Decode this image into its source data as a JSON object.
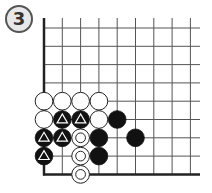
{
  "diagram": {
    "label": "3",
    "type": "go-board-partial",
    "corner": "bottom-left",
    "grid": {
      "origin_x": 44,
      "origin_y": 28,
      "spacing": 18.3,
      "columns": 9,
      "rows": 9,
      "right_extent": 200,
      "top_extent": 18
    },
    "colors": {
      "line": "#555555",
      "edge": "#222222",
      "black_stone": "#111111",
      "white_stone": "#ffffff",
      "stone_outline": "#222222",
      "badge_fill": "#e8e8e8",
      "badge_stroke": "#555555"
    },
    "stones": [
      {
        "col": 0,
        "row": 4,
        "color": "white",
        "mark": "none"
      },
      {
        "col": 1,
        "row": 4,
        "color": "white",
        "mark": "none"
      },
      {
        "col": 2,
        "row": 4,
        "color": "white",
        "mark": "none"
      },
      {
        "col": 3,
        "row": 4,
        "color": "white",
        "mark": "none"
      },
      {
        "col": 0,
        "row": 5,
        "color": "white",
        "mark": "none"
      },
      {
        "col": 1,
        "row": 5,
        "color": "black",
        "mark": "triangle"
      },
      {
        "col": 2,
        "row": 5,
        "color": "black",
        "mark": "triangle"
      },
      {
        "col": 3,
        "row": 5,
        "color": "white",
        "mark": "none"
      },
      {
        "col": 4,
        "row": 5,
        "color": "black",
        "mark": "none"
      },
      {
        "col": 0,
        "row": 6,
        "color": "black",
        "mark": "triangle"
      },
      {
        "col": 1,
        "row": 6,
        "color": "black",
        "mark": "triangle"
      },
      {
        "col": 2,
        "row": 6,
        "color": "white",
        "mark": "double-circle"
      },
      {
        "col": 3,
        "row": 6,
        "color": "black",
        "mark": "none"
      },
      {
        "col": 5,
        "row": 6,
        "color": "black",
        "mark": "none"
      },
      {
        "col": 0,
        "row": 7,
        "color": "black",
        "mark": "triangle"
      },
      {
        "col": 2,
        "row": 7,
        "color": "white",
        "mark": "double-circle"
      },
      {
        "col": 3,
        "row": 7,
        "color": "black",
        "mark": "none"
      },
      {
        "col": 2,
        "row": 8,
        "color": "white",
        "mark": "double-circle"
      }
    ]
  }
}
